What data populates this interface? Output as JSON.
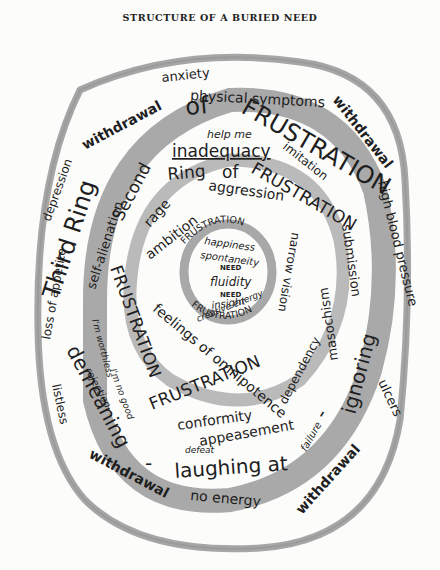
{
  "title": "STRUCTURE OF A BURIED NEED",
  "colors": {
    "background": "#fcfcfb",
    "ring_wash": "#9a9a9a",
    "ring_wash_light": "#b8b8b8",
    "ink": "#1e1e1e"
  },
  "outer_zone": {
    "top": [
      "anxiety",
      "physical symptoms"
    ],
    "upper_left": [
      "withdrawal",
      "depression",
      "loss of appetite",
      "listless"
    ],
    "upper_right": [
      "withdrawal",
      "high blood pressure",
      "ulcers"
    ],
    "bottom": [
      "withdrawal",
      "no energy",
      "withdrawal"
    ]
  },
  "third_ring": {
    "label_parts": [
      "Third Ring",
      "of",
      "FRUSTRATION"
    ],
    "band_words": [
      "demeaning",
      "-",
      "laughing at",
      "-",
      "ignoring"
    ],
    "inside_words": [
      "help me",
      "inadequacy",
      "imitation",
      "self-alienation",
      "submission",
      "masochism",
      "I'm worthless",
      "rejection",
      "I'm no good",
      "defeat",
      "failure"
    ]
  },
  "second_ring": {
    "label_parts": [
      "Second",
      "Ring",
      "of",
      "FRUSTRATION",
      "FRUSTRATION",
      "FRUSTRATION"
    ],
    "inside_words": [
      "rage",
      "ambition",
      "aggression",
      "narrow vision",
      "feelings of omnipotence",
      "dependency",
      "conformity",
      "appeasement"
    ]
  },
  "inner_ring": {
    "label_top": "FRUSTRATION",
    "label_bottom": "FRUSTRATION",
    "core_words": [
      "happiness",
      "spontaneity",
      "NEED",
      "fluidity",
      "NEED",
      "insight",
      "creative energy"
    ]
  }
}
